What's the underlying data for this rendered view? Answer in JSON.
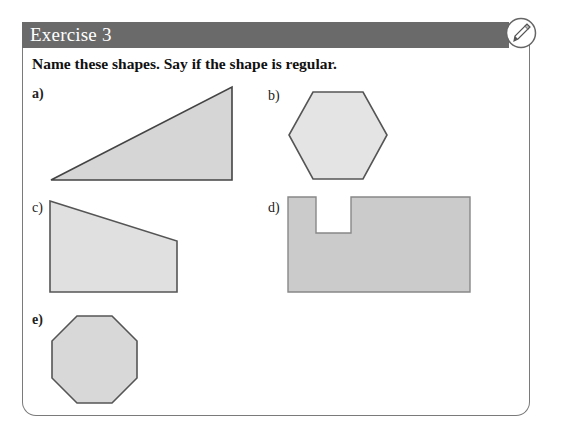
{
  "exercise": {
    "title": "Exercise 3",
    "icon": "pen-icon",
    "instruction": "Name these shapes. Say if the shape is regular."
  },
  "shapes": [
    {
      "label": "a)",
      "kind": "right-angled triangle",
      "points": "51,180 232,87 232,180"
    },
    {
      "label": "b)",
      "kind": "hexagon",
      "points": "313,92 363,92 387,135 363,179 313,179 289,135"
    },
    {
      "label": "c)",
      "kind": "trapezium",
      "points": "50,201 177,241 177,292 50,292"
    },
    {
      "label": "d)",
      "kind": "irregular octagon",
      "points": "288,197 316,197 316,233 351,233 351,197 470,197 470,292 288,292"
    },
    {
      "label": "e)",
      "kind": "octagon",
      "points": "77,316 112,316 137,341 137,378 112,403 77,403 52,378 52,341"
    }
  ],
  "colors": {
    "header": "#6a6a6a",
    "shape_fill_light": "#e2e2e2",
    "shape_fill_dark": "#cbcbcb",
    "shape_stroke": "#555555"
  }
}
